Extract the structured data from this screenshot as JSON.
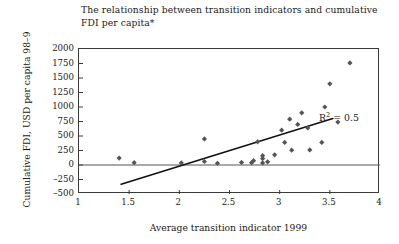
{
  "chart_data": {
    "type": "scatter",
    "title": "The relationship between transition indicators and cumulative FDI per capita*",
    "xlabel": "Average transition indicator 1999",
    "ylabel": "Cumulative FDI, USD per capita 98–9",
    "xlim": [
      1,
      4
    ],
    "ylim": [
      -500,
      2000
    ],
    "xticks": [
      1,
      1.5,
      2,
      2.5,
      3,
      3.5,
      4
    ],
    "xtick_labels": [
      "1",
      "1.5",
      "2",
      "2.5",
      "3",
      "3.5",
      "4"
    ],
    "yticks": [
      -500,
      -250,
      0,
      250,
      500,
      750,
      1000,
      1250,
      1500,
      1750,
      2000
    ],
    "ytick_labels": [
      "–500",
      "–250",
      "0",
      "250",
      "500",
      "750",
      "1000",
      "1250",
      "1500",
      "1750",
      "2000"
    ],
    "grid": false,
    "legend": null,
    "zero_line": 0,
    "marker": "diamond",
    "marker_color": "#555555",
    "points": [
      {
        "x": 1.4,
        "y": 120
      },
      {
        "x": 1.55,
        "y": 40
      },
      {
        "x": 2.02,
        "y": 35
      },
      {
        "x": 2.25,
        "y": 60
      },
      {
        "x": 2.25,
        "y": 450
      },
      {
        "x": 2.38,
        "y": 30
      },
      {
        "x": 2.62,
        "y": 45
      },
      {
        "x": 2.72,
        "y": 40
      },
      {
        "x": 2.74,
        "y": 75
      },
      {
        "x": 2.78,
        "y": 400
      },
      {
        "x": 2.83,
        "y": 35
      },
      {
        "x": 2.83,
        "y": 110
      },
      {
        "x": 2.83,
        "y": 160
      },
      {
        "x": 2.88,
        "y": 55
      },
      {
        "x": 2.95,
        "y": 175
      },
      {
        "x": 3.02,
        "y": 600
      },
      {
        "x": 3.05,
        "y": 390
      },
      {
        "x": 3.1,
        "y": 790
      },
      {
        "x": 3.12,
        "y": 255
      },
      {
        "x": 3.18,
        "y": 700
      },
      {
        "x": 3.22,
        "y": 900
      },
      {
        "x": 3.28,
        "y": 640
      },
      {
        "x": 3.3,
        "y": 260
      },
      {
        "x": 3.42,
        "y": 390
      },
      {
        "x": 3.45,
        "y": 1000
      },
      {
        "x": 3.5,
        "y": 1400
      },
      {
        "x": 3.58,
        "y": 740
      },
      {
        "x": 3.7,
        "y": 1760
      }
    ],
    "trendline": {
      "x_start": 1.42,
      "y_start": -330,
      "x_end": 3.53,
      "y_end": 800,
      "label": "R² = 0.5",
      "label_base": "R",
      "label_exponent": "2",
      "label_value": " = 0.5",
      "r_squared": 0.5
    },
    "axis_color": "#3a3a3a",
    "zero_line_color": "#555555",
    "trendline_color": "#111111"
  }
}
